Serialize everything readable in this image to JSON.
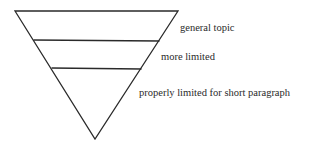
{
  "diagram": {
    "type": "inverted-funnel",
    "levels": [
      {
        "label": "general topic"
      },
      {
        "label": "more limited"
      },
      {
        "label": "properly limited for short paragraph"
      }
    ],
    "stroke_color": "#2a2a2a"
  }
}
